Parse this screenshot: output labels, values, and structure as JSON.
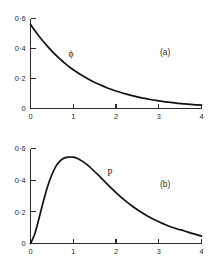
{
  "figure": {
    "background_color": "#ffffff",
    "line_color": "#111111",
    "axis_color": "#2b2b2b"
  },
  "chart_data": [
    {
      "type": "line",
      "panel": "a",
      "panel_label": "(a)",
      "title": "",
      "xlabel": "",
      "ylabel": "",
      "series_label": "ϕ",
      "series_label_x": 0.95,
      "series_label_y": 0.345,
      "panel_label_x": 3.15,
      "panel_label_y": 0.355,
      "xlim": [
        0,
        4
      ],
      "ylim": [
        0,
        0.6
      ],
      "xticks": [
        0,
        1,
        2,
        3,
        4
      ],
      "xtick_labels": [
        "0",
        "1",
        "2",
        "3",
        "4"
      ],
      "yticks": [
        0,
        0.2,
        0.4,
        0.6
      ],
      "ytick_labels": [
        "0",
        "0·2",
        "0·4",
        "0·6"
      ],
      "grid": false,
      "legend": "none",
      "x": [
        0,
        0.1,
        0.2,
        0.3,
        0.4,
        0.5,
        0.6,
        0.7,
        0.8,
        0.9,
        1.0,
        1.2,
        1.4,
        1.6,
        1.8,
        2.0,
        2.2,
        2.4,
        2.6,
        2.8,
        3.0,
        3.2,
        3.4,
        3.6,
        3.8,
        4.0
      ],
      "values": [
        0.56,
        0.52,
        0.482,
        0.447,
        0.414,
        0.383,
        0.354,
        0.327,
        0.302,
        0.279,
        0.258,
        0.221,
        0.189,
        0.161,
        0.137,
        0.117,
        0.099,
        0.084,
        0.071,
        0.06,
        0.051,
        0.043,
        0.036,
        0.031,
        0.026,
        0.022
      ]
    },
    {
      "type": "line",
      "panel": "b",
      "panel_label": "(b)",
      "title": "",
      "xlabel": "",
      "ylabel": "",
      "series_label": "P",
      "series_label_x": 1.86,
      "series_label_y": 0.425,
      "panel_label_x": 3.15,
      "panel_label_y": 0.355,
      "xlim": [
        0,
        4
      ],
      "ylim": [
        0,
        0.6
      ],
      "xticks": [
        0,
        1,
        2,
        3,
        4
      ],
      "xtick_labels": [
        "0",
        "1",
        "2",
        "3",
        "4"
      ],
      "yticks": [
        0,
        0.2,
        0.4,
        0.6
      ],
      "ytick_labels": [
        "0",
        "0·2",
        "0·4",
        "0·6"
      ],
      "grid": false,
      "legend": "none",
      "x": [
        0,
        0.1,
        0.2,
        0.3,
        0.4,
        0.5,
        0.6,
        0.7,
        0.8,
        0.9,
        1.0,
        1.1,
        1.2,
        1.3,
        1.4,
        1.6,
        1.8,
        2.0,
        2.2,
        2.4,
        2.6,
        2.8,
        3.0,
        3.2,
        3.4,
        3.6,
        3.8,
        4.0
      ],
      "values": [
        0.0,
        0.06,
        0.16,
        0.265,
        0.36,
        0.435,
        0.49,
        0.524,
        0.541,
        0.546,
        0.545,
        0.537,
        0.522,
        0.503,
        0.48,
        0.428,
        0.374,
        0.322,
        0.274,
        0.232,
        0.196,
        0.164,
        0.137,
        0.114,
        0.095,
        0.079,
        0.062,
        0.047
      ]
    }
  ]
}
